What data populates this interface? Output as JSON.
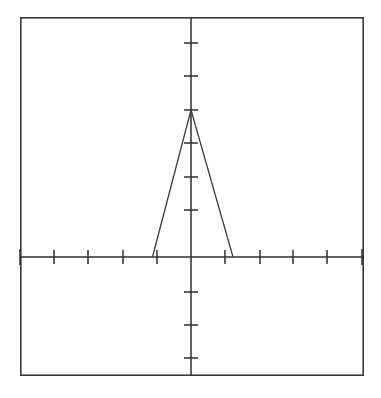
{
  "figure": {
    "background_color": "#ffffff",
    "frame": {
      "x": 20,
      "y": 17,
      "width": 344,
      "height": 359,
      "stroke_color": "#3a3a3a"
    },
    "axis_color": "#2e2e2e",
    "curve_color": "#3c3c3c"
  },
  "chart_data": {
    "type": "line",
    "title": "",
    "subtitle": "",
    "xlabel": "",
    "ylabel": "",
    "grid": false,
    "legend": null,
    "legend_position": "none",
    "annotations": [],
    "origin_pixel": {
      "x": 191,
      "y": 257
    },
    "axis_ranges": {
      "xlim": [
        -5.1,
        5.15
      ],
      "ylim": [
        -3.55,
        3.55
      ]
    },
    "tick_spacing": {
      "x_pixels": 33.6,
      "y_pixels": 33.2,
      "x_value": 1,
      "y_value": 1
    },
    "x_tick_labels": [
      "",
      "",
      "",
      "",
      "",
      "",
      "",
      "",
      "",
      "",
      ""
    ],
    "y_tick_labels": [
      "",
      "",
      "",
      "",
      "",
      "",
      ""
    ],
    "x_ticks_pixels": [
      20,
      54,
      88,
      123,
      157,
      191,
      225,
      260,
      293,
      327,
      362
    ],
    "y_ticks_pixels": [
      43,
      76,
      110,
      143,
      177,
      210,
      292,
      325,
      358
    ],
    "series": [
      {
        "name": "tent-function",
        "points_pixels": [
          {
            "x": 152.5,
            "y": 257
          },
          {
            "x": 191,
            "y": 110
          },
          {
            "x": 233,
            "y": 257
          }
        ],
        "x": [
          -1.15,
          0,
          1.25
        ],
        "values": [
          0,
          4.43,
          0
        ]
      }
    ]
  }
}
